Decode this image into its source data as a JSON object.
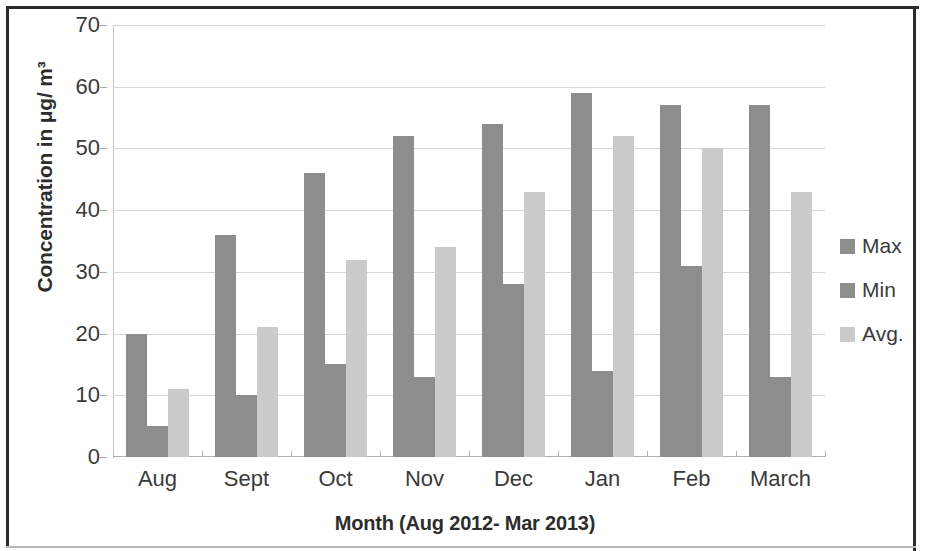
{
  "chart_data": {
    "type": "bar",
    "title": "",
    "xlabel": "Month (Aug 2012- Mar 2013)",
    "ylabel": "Concentration in μg/ m³",
    "categories": [
      "Aug",
      "Sept",
      "Oct",
      "Nov",
      "Dec",
      "Jan",
      "Feb",
      "March"
    ],
    "series": [
      {
        "name": "Max",
        "color": "#8d8d8d",
        "values": [
          20,
          36,
          46,
          52,
          54,
          59,
          57,
          57
        ]
      },
      {
        "name": "Min",
        "color": "#8d8d8d",
        "values": [
          5,
          10,
          15,
          13,
          28,
          14,
          31,
          13
        ]
      },
      {
        "name": "Avg.",
        "color": "#cbcbcb",
        "values": [
          11,
          21,
          32,
          34,
          43,
          52,
          50,
          43
        ]
      }
    ],
    "ylim": [
      0,
      70
    ],
    "ytick_step": 10,
    "ytick_labels": [
      "70",
      "60",
      "50",
      "40",
      "30",
      "20",
      "10",
      "0"
    ],
    "grid": true,
    "legend_position": "right"
  },
  "legend": {
    "items": [
      {
        "label": "Max",
        "color": "#8d8d8d"
      },
      {
        "label": "Min",
        "color": "#8d8d8d"
      },
      {
        "label": "Avg.",
        "color": "#cbcbcb"
      }
    ]
  }
}
